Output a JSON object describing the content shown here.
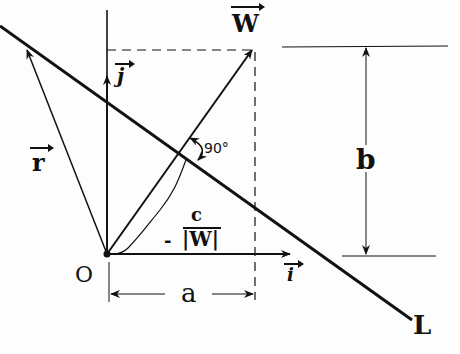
{
  "diagram": {
    "labels": {
      "origin": "O",
      "i": "i",
      "j": "j",
      "r": "r",
      "w": "W",
      "angle": "90°",
      "distance_num": "c",
      "distance_den": "|W|",
      "distance_sign": "-",
      "a": "a",
      "b": "b",
      "line": "L"
    },
    "colors": {
      "ink": "#111111",
      "background": "#fdfdfd"
    }
  }
}
